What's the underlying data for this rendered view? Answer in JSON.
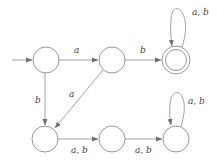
{
  "diagram": {
    "type": "finite-automaton",
    "colors": {
      "stroke": "#8a8a8a",
      "label": "#444444",
      "background": "#ffffff"
    },
    "states": [
      {
        "id": "q0",
        "x": 46,
        "y": 60,
        "start": true,
        "accept": false
      },
      {
        "id": "q1",
        "x": 112,
        "y": 60,
        "start": false,
        "accept": false
      },
      {
        "id": "q2",
        "x": 176,
        "y": 60,
        "start": false,
        "accept": true
      },
      {
        "id": "q3",
        "x": 45,
        "y": 139,
        "start": false,
        "accept": false
      },
      {
        "id": "q4",
        "x": 112,
        "y": 139,
        "start": false,
        "accept": false
      },
      {
        "id": "q5",
        "x": 176,
        "y": 139,
        "start": false,
        "accept": false
      }
    ],
    "transitions": [
      {
        "from": "q0",
        "to": "q1",
        "label": "a"
      },
      {
        "from": "q1",
        "to": "q2",
        "label": "b"
      },
      {
        "from": "q2",
        "to": "q2",
        "label": "a, b"
      },
      {
        "from": "q0",
        "to": "q3",
        "label": "b"
      },
      {
        "from": "q1",
        "to": "q3",
        "label": "a"
      },
      {
        "from": "q3",
        "to": "q4",
        "label": "a, b"
      },
      {
        "from": "q4",
        "to": "q5",
        "label": "a, b"
      },
      {
        "from": "q5",
        "to": "q5",
        "label": "a, b"
      }
    ]
  }
}
